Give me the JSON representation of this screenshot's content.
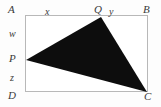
{
  "figure": {
    "kind": "geometry-diagram",
    "canvas": {
      "width": 161,
      "height": 107
    },
    "background_color": "#fdfdfd",
    "rectangle": {
      "name": "ABCD",
      "stroke_color": "#b8b8b8",
      "stroke_width": 1,
      "fill_color": "#ffffff",
      "x": 25,
      "y": 15,
      "width": 123,
      "height": 77
    },
    "triangle": {
      "name": "PQC",
      "fill_color": "#0d0d0d",
      "points": "101,17 147,92 26,60",
      "vertices": [
        {
          "label": "Q",
          "x": 101,
          "y": 17
        },
        {
          "label": "C",
          "x": 147,
          "y": 92
        },
        {
          "label": "P",
          "x": 26,
          "y": 60
        }
      ]
    },
    "labels": [
      {
        "id": "corner-a",
        "text": "A",
        "x": 8,
        "y": 4,
        "size": "normal"
      },
      {
        "id": "segment-x",
        "text": "x",
        "x": 45,
        "y": 6,
        "size": "lower"
      },
      {
        "id": "point-q",
        "text": "Q",
        "x": 94,
        "y": 4,
        "size": "normal"
      },
      {
        "id": "segment-y",
        "text": "y",
        "x": 109,
        "y": 6,
        "size": "lower"
      },
      {
        "id": "corner-b",
        "text": "B",
        "x": 143,
        "y": 4,
        "size": "normal"
      },
      {
        "id": "segment-w",
        "text": "w",
        "x": 9,
        "y": 28,
        "size": "lower"
      },
      {
        "id": "point-p",
        "text": "P",
        "x": 9,
        "y": 53,
        "size": "normal"
      },
      {
        "id": "segment-z",
        "text": "z",
        "x": 10,
        "y": 72,
        "size": "lower"
      },
      {
        "id": "corner-d",
        "text": "D",
        "x": 8,
        "y": 90,
        "size": "normal"
      },
      {
        "id": "corner-c",
        "text": "C",
        "x": 144,
        "y": 91,
        "size": "normal"
      }
    ]
  }
}
